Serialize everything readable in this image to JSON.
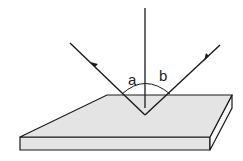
{
  "diagram": {
    "labels": {
      "angle_a": "a",
      "angle_b": "b"
    },
    "colors": {
      "line": "#1a1a1a",
      "plate_fill": "#e4e4e4",
      "plate_side": "#f4f4f4"
    }
  }
}
